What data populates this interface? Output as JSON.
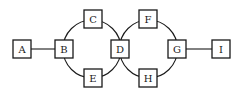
{
  "diagram": {
    "type": "graph",
    "colors": {
      "stroke": "#1a1a1a",
      "background": "#ffffff"
    },
    "nodes": [
      {
        "id": "A",
        "label": "A",
        "cx": 22,
        "cy": 49
      },
      {
        "id": "B",
        "label": "B",
        "cx": 64,
        "cy": 49
      },
      {
        "id": "C",
        "label": "C",
        "cx": 93,
        "cy": 19
      },
      {
        "id": "D",
        "label": "D",
        "cx": 120,
        "cy": 49
      },
      {
        "id": "E",
        "label": "E",
        "cx": 93,
        "cy": 78
      },
      {
        "id": "F",
        "label": "F",
        "cx": 148,
        "cy": 19
      },
      {
        "id": "G",
        "label": "G",
        "cx": 177,
        "cy": 49
      },
      {
        "id": "H",
        "label": "H",
        "cx": 148,
        "cy": 78
      },
      {
        "id": "I",
        "label": "I",
        "cx": 221,
        "cy": 49
      }
    ],
    "edges": [
      {
        "from": "A",
        "to": "B",
        "shape": "line"
      },
      {
        "from": "B",
        "to": "C",
        "shape": "arc"
      },
      {
        "from": "C",
        "to": "D",
        "shape": "arc"
      },
      {
        "from": "D",
        "to": "E",
        "shape": "arc"
      },
      {
        "from": "E",
        "to": "B",
        "shape": "arc"
      },
      {
        "from": "D",
        "to": "F",
        "shape": "arc"
      },
      {
        "from": "F",
        "to": "G",
        "shape": "arc"
      },
      {
        "from": "G",
        "to": "H",
        "shape": "arc"
      },
      {
        "from": "H",
        "to": "D",
        "shape": "arc"
      },
      {
        "from": "G",
        "to": "I",
        "shape": "line"
      }
    ]
  }
}
